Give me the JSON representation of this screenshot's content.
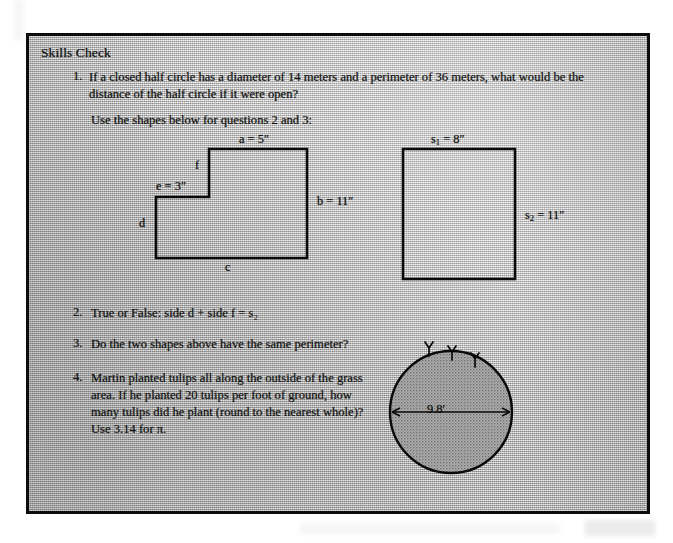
{
  "document": {
    "title": "Skills Check"
  },
  "questions": [
    {
      "number": "1.",
      "text": "If a closed half circle has a diameter of 14 meters and a perimeter of 36 meters, what would be the distance of the half circle if it were open?"
    },
    {
      "number": "2.",
      "text": "True or False: side d + side f = s₂"
    },
    {
      "number": "3.",
      "text": "Do the two shapes above have the same perimeter?"
    },
    {
      "number": "4.",
      "text": "Martin planted tulips all along the outside of the grass area. If he planted 20 tulips per foot of ground, how many tulips did he plant (round to the nearest whole)? Use 3.14 for π."
    }
  ],
  "instruction": {
    "text": "Use the shapes below for questions 2 and 3:"
  },
  "figures": {
    "l_shape": {
      "name": "L-shaped figure",
      "labels": {
        "a": "a = 5″",
        "b": "b = 11″",
        "c": "c",
        "d": "d",
        "e": "e = 3″",
        "f": "f"
      }
    },
    "square": {
      "name": "square figure",
      "labels": {
        "s1_top": "s",
        "s1_sub": "1",
        "s1_value": " = 8″",
        "s2_side": "s",
        "s2_sub": "2",
        "s2_value": " = 11″"
      }
    },
    "circle": {
      "name": "grass area circle",
      "diameter_label": "9.8′",
      "tulip_count": 3
    }
  },
  "colors": {
    "ink": "#121212",
    "paper": "#b9b9b9",
    "border": "#0d0d0d"
  }
}
